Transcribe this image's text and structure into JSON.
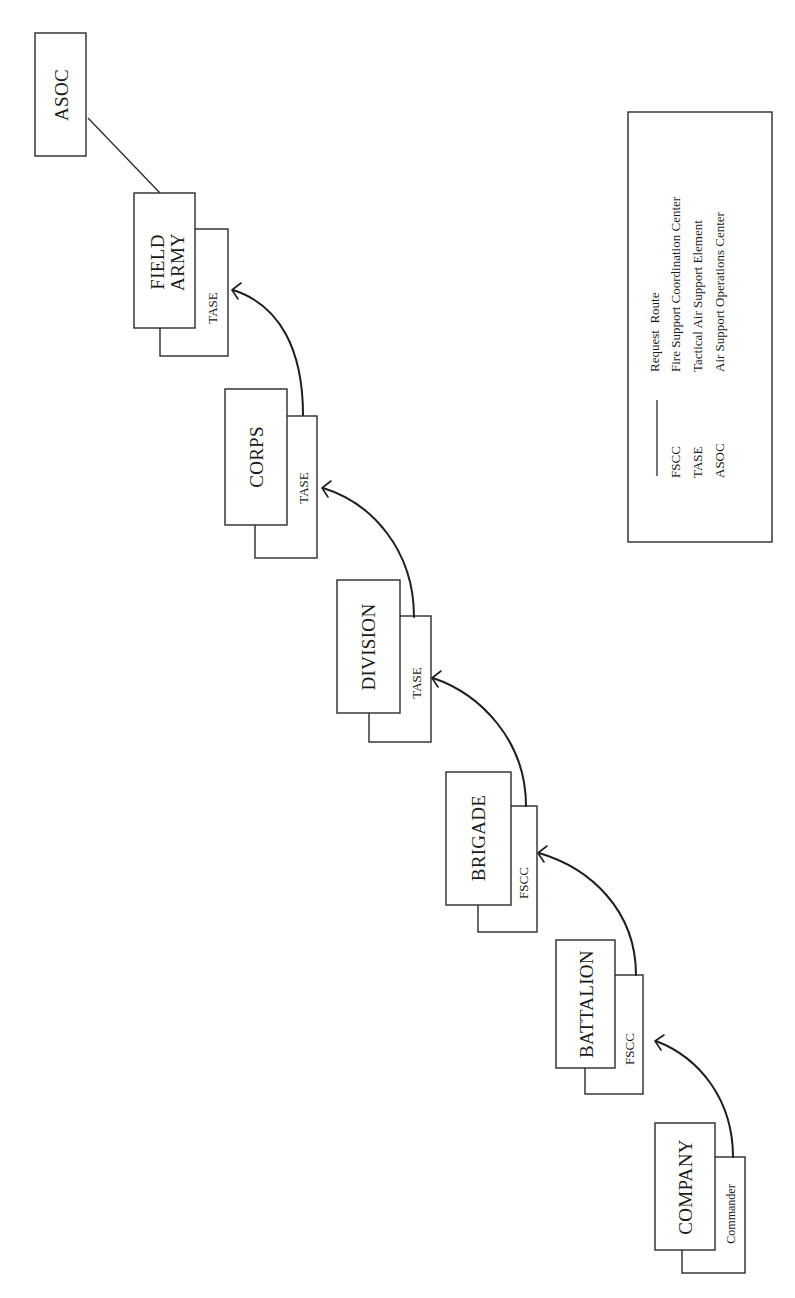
{
  "diagram": {
    "orientation": "rotated-90-ccw",
    "colors": {
      "stroke": "#2a2a2a",
      "background": "#ffffff",
      "text": "#1a1a1a"
    },
    "echelons": [
      {
        "name": "COMPANY",
        "element": "Commander"
      },
      {
        "name": "BATTALION",
        "element": "FSCC"
      },
      {
        "name": "BRIGADE",
        "element": "FSCC"
      },
      {
        "name": "DIVISION",
        "element": "TASE"
      },
      {
        "name": "CORPS",
        "element": "TASE"
      },
      {
        "name_line1": "FIELD",
        "name_line2": "ARMY",
        "element": "TASE"
      }
    ],
    "top_node": {
      "name": "ASOC"
    },
    "request_route": [
      "COMPANY Commander → BATTALION FSCC",
      "BATTALION FSCC → BRIGADE FSCC",
      "BRIGADE FSCC → DIVISION TASE",
      "DIVISION TASE → CORPS TASE",
      "CORPS TASE → FIELD ARMY TASE",
      "FIELD ARMY → ASOC"
    ]
  },
  "legend": {
    "items": [
      {
        "symbol": "line",
        "abbr": "",
        "label": "Request  Route"
      },
      {
        "symbol": "text",
        "abbr": "FSCC",
        "label": "Fire Support Coordination Center"
      },
      {
        "symbol": "text",
        "abbr": "TASE",
        "label": "Tactical Air Support Element"
      },
      {
        "symbol": "text",
        "abbr": "ASOC",
        "label": "Air Support Operations Center"
      }
    ]
  }
}
